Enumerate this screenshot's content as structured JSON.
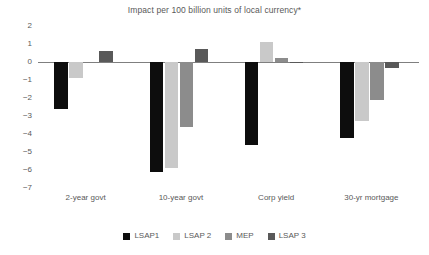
{
  "chart_data": {
    "type": "bar",
    "title": "Impact per 100 billion units of local currency*",
    "xlabel": "",
    "ylabel": "",
    "ylim": [
      -7,
      2
    ],
    "yticks": [
      2,
      1,
      0,
      -1,
      -2,
      -3,
      -4,
      -5,
      -6,
      -7
    ],
    "ytick_labels": [
      "2",
      "1",
      "0",
      "−1",
      "−2",
      "−3",
      "−4",
      "−5",
      "−6",
      "−7"
    ],
    "grid": false,
    "legend_position": "bottom",
    "categories": [
      "2-year govt",
      "10-year govt",
      "Corp yield",
      "30-yr mortgage"
    ],
    "series": [
      {
        "name": "LSAP1",
        "color": "#0d0d0d",
        "values": [
          -2.6,
          -6.1,
          -4.6,
          -4.2
        ]
      },
      {
        "name": "LSAP 2",
        "color": "#c9c9c9",
        "values": [
          -0.9,
          -5.9,
          1.1,
          -3.3
        ]
      },
      {
        "name": "MEP",
        "color": "#8c8c8c",
        "values": [
          0.0,
          -3.6,
          0.2,
          -2.1
        ]
      },
      {
        "name": "LSAP 3",
        "color": "#595959",
        "values": [
          0.6,
          0.7,
          -0.05,
          -0.35
        ]
      }
    ]
  },
  "legend": {
    "items": [
      {
        "label": "LSAP1",
        "color": "#0d0d0d"
      },
      {
        "label": "LSAP 2",
        "color": "#c9c9c9"
      },
      {
        "label": "MEP",
        "color": "#8c8c8c"
      },
      {
        "label": "LSAP 3",
        "color": "#595959"
      }
    ]
  },
  "axis": {
    "zero_line_color": "#7f7f7f"
  }
}
